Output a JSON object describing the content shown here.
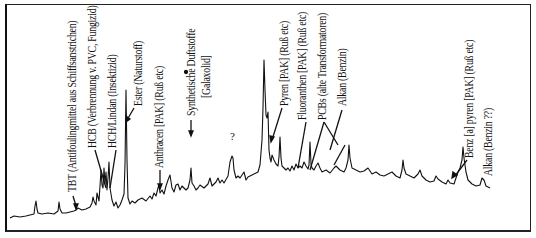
{
  "chart_data": {
    "type": "line",
    "title": "",
    "xlabel": "",
    "ylabel": "",
    "grid": false,
    "legend": false,
    "trace_points": [
      [
        10,
        218
      ],
      [
        14,
        216
      ],
      [
        20,
        217
      ],
      [
        26,
        216
      ],
      [
        30,
        215
      ],
      [
        34,
        214
      ],
      [
        35,
        206
      ],
      [
        36,
        201
      ],
      [
        37,
        209
      ],
      [
        38,
        213
      ],
      [
        42,
        214
      ],
      [
        48,
        213
      ],
      [
        54,
        214
      ],
      [
        58,
        211
      ],
      [
        59,
        202
      ],
      [
        60,
        209
      ],
      [
        62,
        213
      ],
      [
        66,
        213
      ],
      [
        70,
        212
      ],
      [
        74,
        211
      ],
      [
        76,
        210
      ],
      [
        78,
        208
      ],
      [
        82,
        210
      ],
      [
        86,
        209
      ],
      [
        90,
        207
      ],
      [
        92,
        203
      ],
      [
        93,
        197
      ],
      [
        94,
        201
      ],
      [
        96,
        205
      ],
      [
        97,
        193
      ],
      [
        98,
        197
      ],
      [
        99,
        201
      ],
      [
        100,
        186
      ],
      [
        101,
        170
      ],
      [
        102,
        185
      ],
      [
        103,
        188
      ],
      [
        104,
        168
      ],
      [
        105,
        184
      ],
      [
        106,
        172
      ],
      [
        107,
        190
      ],
      [
        108,
        178
      ],
      [
        109,
        162
      ],
      [
        110,
        188
      ],
      [
        112,
        200
      ],
      [
        114,
        206
      ],
      [
        116,
        202
      ],
      [
        118,
        208
      ],
      [
        120,
        205
      ],
      [
        122,
        200
      ],
      [
        124,
        194
      ],
      [
        125,
        165
      ],
      [
        126,
        90
      ],
      [
        127,
        160
      ],
      [
        128,
        198
      ],
      [
        130,
        204
      ],
      [
        132,
        201
      ],
      [
        135,
        203
      ],
      [
        138,
        200
      ],
      [
        142,
        198
      ],
      [
        146,
        201
      ],
      [
        150,
        196
      ],
      [
        152,
        199
      ],
      [
        154,
        193
      ],
      [
        156,
        196
      ],
      [
        158,
        188
      ],
      [
        159,
        185
      ],
      [
        160,
        193
      ],
      [
        162,
        190
      ],
      [
        164,
        194
      ],
      [
        166,
        186
      ],
      [
        168,
        180
      ],
      [
        170,
        175
      ],
      [
        172,
        188
      ],
      [
        174,
        192
      ],
      [
        176,
        185
      ],
      [
        178,
        184
      ],
      [
        180,
        190
      ],
      [
        182,
        186
      ],
      [
        186,
        190
      ],
      [
        188,
        188
      ],
      [
        190,
        180
      ],
      [
        191,
        168
      ],
      [
        192,
        183
      ],
      [
        194,
        186
      ],
      [
        196,
        190
      ],
      [
        198,
        188
      ],
      [
        200,
        185
      ],
      [
        204,
        188
      ],
      [
        208,
        184
      ],
      [
        210,
        178
      ],
      [
        212,
        186
      ],
      [
        216,
        182
      ],
      [
        218,
        178
      ],
      [
        220,
        183
      ],
      [
        222,
        180
      ],
      [
        224,
        183
      ],
      [
        228,
        176
      ],
      [
        230,
        162
      ],
      [
        232,
        156
      ],
      [
        233,
        158
      ],
      [
        234,
        170
      ],
      [
        236,
        178
      ],
      [
        238,
        176
      ],
      [
        240,
        178
      ],
      [
        244,
        172
      ],
      [
        246,
        180
      ],
      [
        248,
        177
      ],
      [
        252,
        175
      ],
      [
        256,
        173
      ],
      [
        258,
        172
      ],
      [
        260,
        165
      ],
      [
        262,
        140
      ],
      [
        263,
        108
      ],
      [
        264,
        60
      ],
      [
        265,
        90
      ],
      [
        266,
        115
      ],
      [
        267,
        118
      ],
      [
        268,
        112
      ],
      [
        269,
        150
      ],
      [
        270,
        158
      ],
      [
        271,
        162
      ],
      [
        272,
        155
      ],
      [
        274,
        160
      ],
      [
        276,
        164
      ],
      [
        278,
        166
      ],
      [
        279,
        157
      ],
      [
        280,
        137
      ],
      [
        281,
        158
      ],
      [
        282,
        166
      ],
      [
        284,
        168
      ],
      [
        286,
        170
      ],
      [
        288,
        168
      ],
      [
        290,
        171
      ],
      [
        292,
        166
      ],
      [
        294,
        170
      ],
      [
        296,
        164
      ],
      [
        298,
        168
      ],
      [
        300,
        166
      ],
      [
        302,
        168
      ],
      [
        304,
        162
      ],
      [
        306,
        166
      ],
      [
        308,
        169
      ],
      [
        309,
        165
      ],
      [
        310,
        142
      ],
      [
        311,
        164
      ],
      [
        312,
        168
      ],
      [
        314,
        170
      ],
      [
        316,
        166
      ],
      [
        318,
        163
      ],
      [
        320,
        168
      ],
      [
        322,
        172
      ],
      [
        326,
        170
      ],
      [
        330,
        173
      ],
      [
        334,
        168
      ],
      [
        336,
        166
      ],
      [
        338,
        168
      ],
      [
        340,
        170
      ],
      [
        344,
        172
      ],
      [
        346,
        168
      ],
      [
        348,
        160
      ],
      [
        349,
        145
      ],
      [
        350,
        158
      ],
      [
        352,
        168
      ],
      [
        356,
        170
      ],
      [
        360,
        172
      ],
      [
        364,
        171
      ],
      [
        368,
        168
      ],
      [
        372,
        174
      ],
      [
        376,
        172
      ],
      [
        380,
        175
      ],
      [
        384,
        176
      ],
      [
        388,
        174
      ],
      [
        392,
        172
      ],
      [
        396,
        176
      ],
      [
        400,
        178
      ],
      [
        402,
        170
      ],
      [
        403,
        160
      ],
      [
        404,
        168
      ],
      [
        406,
        174
      ],
      [
        410,
        176
      ],
      [
        414,
        178
      ],
      [
        418,
        174
      ],
      [
        420,
        170
      ],
      [
        422,
        176
      ],
      [
        426,
        180
      ],
      [
        430,
        182
      ],
      [
        434,
        181
      ],
      [
        436,
        176
      ],
      [
        438,
        179
      ],
      [
        442,
        182
      ],
      [
        446,
        184
      ],
      [
        448,
        180
      ],
      [
        450,
        183
      ],
      [
        454,
        184
      ],
      [
        456,
        178
      ],
      [
        458,
        172
      ],
      [
        460,
        168
      ],
      [
        462,
        160
      ],
      [
        463,
        147
      ],
      [
        464,
        158
      ],
      [
        466,
        172
      ],
      [
        468,
        180
      ],
      [
        472,
        184
      ],
      [
        476,
        186
      ],
      [
        480,
        185
      ],
      [
        482,
        178
      ],
      [
        484,
        180
      ],
      [
        486,
        186
      ],
      [
        490,
        188
      ]
    ],
    "peak_annotations": [
      {
        "label": "TBT (Antifoulingmittel aus Schiffsanstrichen)",
        "peak_x": 76
      },
      {
        "label": "HCB (Verbrennung v. PVC, Fungizid)",
        "peak_x": 104
      },
      {
        "label": "HCH/Lindan (Insektizid)",
        "peak_x": 109
      },
      {
        "label": "Ester (Naturstoff)",
        "peak_x": 126
      },
      {
        "label": "Anthracen [PAK]  (Ruß etc)",
        "peak_x": 159
      },
      {
        "label": "Synthetische Duftstoffe",
        "peak_x": 191
      },
      {
        "label": "[Galaxolid]",
        "peak_x": 191
      },
      {
        "label": "?",
        "peak_x": 232
      },
      {
        "label": "Pyren [PAK] (Ruß etc)",
        "peak_x": 267
      },
      {
        "label": "Fluoranthen [PAK] (Ruß etc)",
        "peak_x": 296
      },
      {
        "label": "PCBs (alte Transformatoren)",
        "peak_x": 310
      },
      {
        "label": "Alkan (Benzin)",
        "peak_x": 322
      },
      {
        "label": "Benz [a] pyren [PAK] (Ruß etc)",
        "peak_x": 458
      },
      {
        "label": "Alkan (Benzin ??)",
        "peak_x": 463
      }
    ]
  },
  "labels": {
    "tbt": "TBT (Antifoulingmittel aus Schiffsanstrichen)",
    "hcb": "HCB (Verbrennung v. PVC, Fungizid)",
    "hch": "HCH/Lindan (Insektizid)",
    "ester": "Ester (Naturstoff)",
    "anthracen": "Anthracen [PAK]  (Ruß etc)",
    "duftstoffe": "Synthetische Duftstoffe",
    "galaxolid": "[Galaxolid]",
    "question": "?",
    "pyren": "Pyren [PAK] (Ruß etc)",
    "fluoranthen": "Fluoranthen [PAK] (Ruß etc)",
    "pcbs": "PCBs (alte Transformatoren)",
    "alkan": "Alkan (Benzin)",
    "benzapyren": "Benz [a] pyren [PAK] (Ruß etc)",
    "alkan2": "Alkan (Benzin ??)"
  },
  "colors": {
    "trace": "#111111",
    "frame": "#222222",
    "background": "#ffffff"
  }
}
